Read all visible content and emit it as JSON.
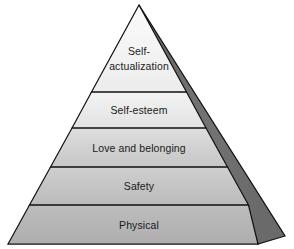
{
  "diagram": {
    "name": "hierarchy-of-needs-pyramid",
    "type": "pyramid",
    "background_color": "#ffffff",
    "outline_color": "#111111",
    "side_face_color": "#707070",
    "text_color": "#1a1a1a",
    "apex": {
      "x": 139,
      "y": 5
    },
    "base_left": {
      "x": 8,
      "y": 244
    },
    "base_right_front": {
      "x": 258,
      "y": 244
    },
    "base_right_back": {
      "x": 285,
      "y": 236
    },
    "tiers": [
      {
        "id": "self-actualization",
        "label": "Self-actualization",
        "label_lines": [
          "Self-",
          "actualization"
        ],
        "level": 5,
        "fill_top": "#fbfbfb",
        "fill_bottom": "#ececed",
        "top_y": 5,
        "bottom_y": 92
      },
      {
        "id": "self-esteem",
        "label": "Self-esteem",
        "label_lines": [
          "Self-esteem"
        ],
        "level": 4,
        "fill_top": "#f4f4f4",
        "fill_bottom": "#e2e2e3",
        "top_y": 92,
        "bottom_y": 128
      },
      {
        "id": "love-and-belonging",
        "label": "Love and belonging",
        "label_lines": [
          "Love and belonging"
        ],
        "level": 3,
        "fill_top": "#dededf",
        "fill_bottom": "#c6c6c7",
        "top_y": 128,
        "bottom_y": 167
      },
      {
        "id": "safety",
        "label": "Safety",
        "label_lines": [
          "Safety"
        ],
        "level": 2,
        "fill_top": "#cfcfd0",
        "fill_bottom": "#bbbbbc",
        "top_y": 167,
        "bottom_y": 205
      },
      {
        "id": "physical",
        "label": "Physical",
        "label_lines": [
          "Physical"
        ],
        "level": 1,
        "fill_top": "#bdbdbe",
        "fill_bottom": "#aeaeaf",
        "top_y": 205,
        "bottom_y": 244
      }
    ]
  }
}
